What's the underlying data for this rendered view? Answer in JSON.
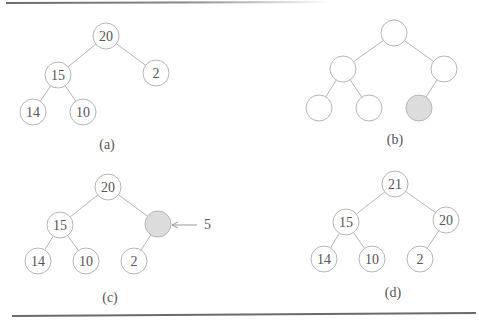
{
  "figure": {
    "panels": [
      {
        "label": "(a)",
        "nodes": [
          {
            "id": "a0",
            "value": "20",
            "x": 106,
            "y": 36
          },
          {
            "id": "a1",
            "value": "15",
            "x": 58,
            "y": 75
          },
          {
            "id": "a2",
            "value": "2",
            "x": 156,
            "y": 73
          },
          {
            "id": "a3",
            "value": "14",
            "x": 33,
            "y": 112
          },
          {
            "id": "a4",
            "value": "10",
            "x": 83,
            "y": 112
          }
        ],
        "edges": [
          [
            "a0",
            "a1"
          ],
          [
            "a0",
            "a2"
          ],
          [
            "a1",
            "a3"
          ],
          [
            "a1",
            "a4"
          ]
        ],
        "label_pos": {
          "x": 107,
          "y": 149
        }
      },
      {
        "label": "(b)",
        "nodes": [
          {
            "id": "b0",
            "value": "",
            "x": 394,
            "y": 33
          },
          {
            "id": "b1",
            "value": "",
            "x": 343,
            "y": 69
          },
          {
            "id": "b2",
            "value": "",
            "x": 444,
            "y": 69
          },
          {
            "id": "b3",
            "value": "",
            "x": 319,
            "y": 108
          },
          {
            "id": "b4",
            "value": "",
            "x": 369,
            "y": 108
          },
          {
            "id": "b5",
            "value": "",
            "x": 419,
            "y": 108,
            "highlight": true
          }
        ],
        "edges": [
          [
            "b0",
            "b1"
          ],
          [
            "b0",
            "b2"
          ],
          [
            "b1",
            "b3"
          ],
          [
            "b1",
            "b4"
          ],
          [
            "b2",
            "b5"
          ]
        ],
        "label_pos": {
          "x": 395,
          "y": 144
        }
      },
      {
        "label": "(c)",
        "nodes": [
          {
            "id": "c0",
            "value": "20",
            "x": 108,
            "y": 187
          },
          {
            "id": "c1",
            "value": "15",
            "x": 60,
            "y": 225
          },
          {
            "id": "c2",
            "value": "",
            "x": 158,
            "y": 224,
            "highlight": true
          },
          {
            "id": "c3",
            "value": "14",
            "x": 38,
            "y": 261
          },
          {
            "id": "c4",
            "value": "10",
            "x": 86,
            "y": 261
          },
          {
            "id": "c5",
            "value": "2",
            "x": 134,
            "y": 261
          }
        ],
        "edges": [
          [
            "c0",
            "c1"
          ],
          [
            "c0",
            "c2"
          ],
          [
            "c1",
            "c3"
          ],
          [
            "c1",
            "c4"
          ],
          [
            "c2",
            "c5"
          ]
        ],
        "label_pos": {
          "x": 110,
          "y": 302
        },
        "annotation": {
          "text": "5",
          "arrow_from": {
            "x": 197,
            "y": 225
          },
          "arrow_to": {
            "x": 172,
            "y": 225
          },
          "text_pos": {
            "x": 204,
            "y": 229
          }
        }
      },
      {
        "label": "(d)",
        "nodes": [
          {
            "id": "d0",
            "value": "21",
            "x": 395,
            "y": 184
          },
          {
            "id": "d1",
            "value": "15",
            "x": 346,
            "y": 222
          },
          {
            "id": "d2",
            "value": "20",
            "x": 446,
            "y": 220
          },
          {
            "id": "d3",
            "value": "14",
            "x": 324,
            "y": 259
          },
          {
            "id": "d4",
            "value": "10",
            "x": 372,
            "y": 259
          },
          {
            "id": "d5",
            "value": "2",
            "x": 420,
            "y": 259
          }
        ],
        "edges": [
          [
            "d0",
            "d1"
          ],
          [
            "d0",
            "d2"
          ],
          [
            "d1",
            "d3"
          ],
          [
            "d1",
            "d4"
          ],
          [
            "d2",
            "d5"
          ]
        ],
        "label_pos": {
          "x": 393,
          "y": 297
        }
      }
    ],
    "node_radius": 13,
    "colors": {
      "stroke": "#b5b5b5",
      "highlight_fill": "#dcdcdc",
      "text": "#555555",
      "rule": "#6e6a6c"
    }
  }
}
